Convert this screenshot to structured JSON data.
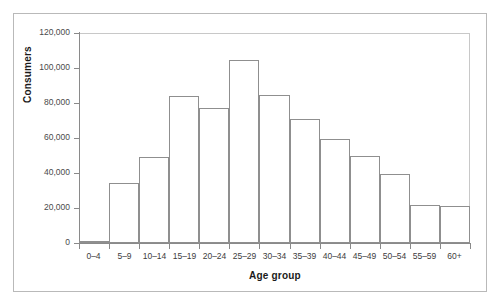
{
  "chart_data": {
    "type": "bar",
    "title": "",
    "subtitle": "",
    "xlabel": "Age group",
    "ylabel": "Consumers",
    "categories": [
      "0–4",
      "5–9",
      "10–14",
      "15–19",
      "20–24",
      "25–29",
      "30–34",
      "35–39",
      "40–44",
      "45–49",
      "50–54",
      "55–59",
      "60+"
    ],
    "values": [
      1000,
      34500,
      49000,
      84000,
      77000,
      104500,
      84500,
      71000,
      59500,
      49500,
      39500,
      22000,
      21000
    ],
    "ylim": [
      0,
      120000
    ],
    "xlim_note": "13 equal-width adjacent bins",
    "y_ticks": [
      0,
      20000,
      40000,
      60000,
      80000,
      100000,
      120000
    ],
    "y_tick_labels": [
      "0",
      "20,000",
      "40,000",
      "60,000",
      "80,000",
      "100,000",
      "120,000"
    ],
    "grid": false,
    "legend": false,
    "legend_position": "none",
    "bar_fill_color": "#ffffff",
    "bar_edge_color": "#8f8f8f",
    "axis_color": "#8a8a8a",
    "frame_color": "#b9b9b9",
    "background_color": "#ffffff",
    "annotations": []
  }
}
